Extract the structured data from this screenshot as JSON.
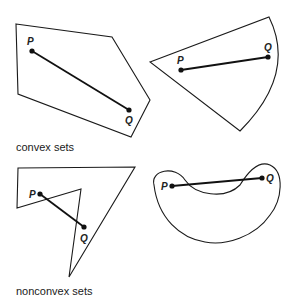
{
  "captions": {
    "convex": "convex sets",
    "nonconvex": "nonconvex sets"
  },
  "labels": {
    "p": "P",
    "q": "Q"
  },
  "figures": [
    {
      "name": "convex-pentagon",
      "type": "convex",
      "P": [
        32,
        51
      ],
      "Q": [
        129,
        110
      ]
    },
    {
      "name": "convex-sector",
      "type": "convex",
      "P": [
        181,
        70
      ],
      "Q": [
        268,
        57
      ]
    },
    {
      "name": "nonconvex-polygon",
      "type": "nonconvex",
      "P": [
        40,
        194
      ],
      "Q": [
        84,
        227
      ]
    },
    {
      "name": "nonconvex-bean",
      "type": "nonconvex",
      "P": [
        172,
        186
      ],
      "Q": [
        262,
        178
      ]
    }
  ]
}
